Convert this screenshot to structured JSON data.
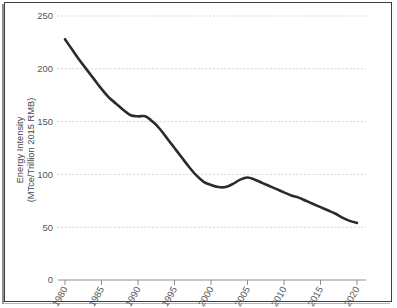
{
  "figure": {
    "border_color": "#3c3c42",
    "background": "#ffffff"
  },
  "chart_data": {
    "type": "line",
    "title": "",
    "subtitle": "",
    "xlabel": "",
    "ylabel": "Energy Intensity (MTce/Trillion 2015 RMB)",
    "ylabel_line1": "Energy Intensity",
    "ylabel_line2": "(MTce/Trillion 2015 RMB)",
    "xlim": [
      1980,
      2020
    ],
    "ylim": [
      0,
      250
    ],
    "grid": true,
    "grid_axis": "y",
    "legend": "none",
    "line_color": "#2b2b2f",
    "grid_color": "#d2d2d4",
    "axis_color": "#8c8c90",
    "y_ticks": [
      0,
      50,
      100,
      150,
      200,
      250
    ],
    "y_tick_labels": [
      "0",
      "50",
      "100",
      "150",
      "200",
      "250"
    ],
    "x_ticks": [
      1980,
      1985,
      1990,
      1995,
      2000,
      2005,
      2010,
      2015,
      2020
    ],
    "x_tick_labels": [
      "1980",
      "1985",
      "1990",
      "1995",
      "2000",
      "2005",
      "2010",
      "2015",
      "2020"
    ],
    "series": [
      {
        "name": "Energy Intensity",
        "x": [
          1980,
          1981,
          1982,
          1983,
          1984,
          1985,
          1986,
          1987,
          1988,
          1989,
          1990,
          1991,
          1992,
          1993,
          1994,
          1995,
          1996,
          1997,
          1998,
          1999,
          2000,
          2001,
          2002,
          2003,
          2004,
          2005,
          2006,
          2007,
          2008,
          2009,
          2010,
          2011,
          2012,
          2013,
          2014,
          2015,
          2016,
          2017,
          2018,
          2019,
          2020
        ],
        "values": [
          228,
          218,
          208,
          199,
          190,
          181,
          173,
          167,
          161,
          156,
          155,
          155,
          150,
          143,
          134,
          125,
          116,
          107,
          99,
          93,
          90,
          88,
          88,
          91,
          95,
          97,
          95,
          92,
          89,
          86,
          83,
          80,
          78,
          75,
          72,
          69,
          66,
          63,
          59,
          56,
          54
        ]
      }
    ]
  }
}
